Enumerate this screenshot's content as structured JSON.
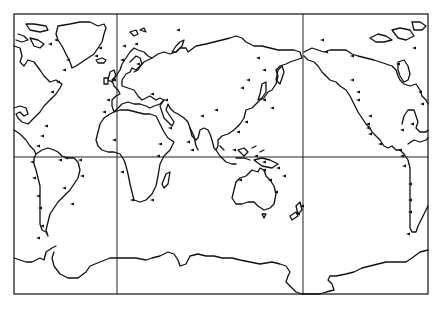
{
  "map": {
    "title": "",
    "projection": "equirectangular world map, split at Pacific, with wrap-around of Americas",
    "colors": {
      "background": "#ffffff",
      "line": "#111111"
    },
    "frame": {
      "x": 14,
      "y": 14,
      "width": 414,
      "height": 280
    },
    "grid": {
      "vertical_lines_x": [
        117,
        303
      ],
      "horizontal_lines_y": [
        157
      ]
    },
    "features": {
      "landmasses": [
        "Greenland",
        "North America (east)",
        "South America",
        "Europe",
        "Africa",
        "Asia",
        "Australia",
        "New Zealand",
        "Antarctica",
        "North America (west, repeated)",
        "South America (repeated)"
      ],
      "markers": "small flag/pennant ticks along coastlines marking stations"
    },
    "markers": [
      [
        44,
        126
      ],
      [
        40,
        136
      ],
      [
        36,
        146
      ],
      [
        30,
        162
      ],
      [
        32,
        178
      ],
      [
        36,
        196
      ],
      [
        38,
        208
      ],
      [
        40,
        226
      ],
      [
        36,
        238
      ],
      [
        62,
        188
      ],
      [
        70,
        204
      ],
      [
        80,
        176
      ],
      [
        78,
        160
      ],
      [
        64,
        158
      ],
      [
        58,
        160
      ],
      [
        50,
        92
      ],
      [
        56,
        82
      ],
      [
        62,
        70
      ],
      [
        66,
        60
      ],
      [
        48,
        44
      ],
      [
        54,
        40
      ],
      [
        94,
        56
      ],
      [
        98,
        48
      ],
      [
        122,
        46
      ],
      [
        120,
        60
      ],
      [
        112,
        80
      ],
      [
        106,
        100
      ],
      [
        102,
        112
      ],
      [
        112,
        140
      ],
      [
        120,
        172
      ],
      [
        130,
        200
      ],
      [
        150,
        200
      ],
      [
        156,
        156
      ],
      [
        158,
        144
      ],
      [
        168,
        128
      ],
      [
        164,
        100
      ],
      [
        176,
        30
      ],
      [
        134,
        44
      ],
      [
        136,
        64
      ],
      [
        150,
        94
      ],
      [
        186,
        142
      ],
      [
        190,
        150
      ],
      [
        200,
        116
      ],
      [
        214,
        110
      ],
      [
        240,
        88
      ],
      [
        246,
        80
      ],
      [
        256,
        58
      ],
      [
        262,
        70
      ],
      [
        262,
        100
      ],
      [
        270,
        108
      ],
      [
        244,
        122
      ],
      [
        236,
        132
      ],
      [
        232,
        150
      ],
      [
        254,
        156
      ],
      [
        262,
        162
      ],
      [
        262,
        170
      ],
      [
        276,
        168
      ],
      [
        282,
        176
      ],
      [
        268,
        180
      ],
      [
        238,
        180
      ],
      [
        274,
        192
      ],
      [
        300,
        206
      ],
      [
        296,
        214
      ],
      [
        320,
        40
      ],
      [
        324,
        52
      ],
      [
        350,
        56
      ],
      [
        350,
        80
      ],
      [
        356,
        92
      ],
      [
        356,
        100
      ],
      [
        368,
        116
      ],
      [
        366,
        124
      ],
      [
        366,
        128
      ],
      [
        368,
        134
      ],
      [
        378,
        144
      ],
      [
        400,
        130
      ],
      [
        410,
        124
      ],
      [
        420,
        104
      ],
      [
        418,
        92
      ],
      [
        396,
        64
      ],
      [
        412,
        48
      ],
      [
        398,
        150
      ],
      [
        400,
        156
      ],
      [
        402,
        166
      ],
      [
        408,
        184
      ],
      [
        408,
        200
      ],
      [
        408,
        212
      ],
      [
        406,
        234
      ]
    ]
  }
}
